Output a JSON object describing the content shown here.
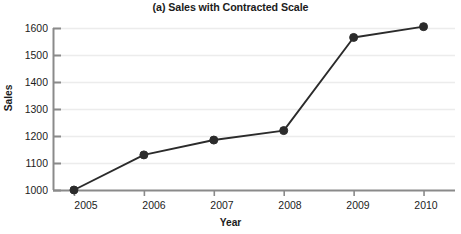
{
  "chart_data": {
    "type": "line",
    "title": "(a) Sales with Contracted Scale",
    "xlabel": "Year",
    "ylabel": "Sales",
    "categories": [
      "2005",
      "2006",
      "2007",
      "2008",
      "2009",
      "2010"
    ],
    "x": [
      2005,
      2006,
      2007,
      2008,
      2009,
      2010
    ],
    "values": [
      1000,
      1130,
      1185,
      1220,
      1565,
      1605
    ],
    "series": [
      {
        "name": "Sales",
        "values": [
          1000,
          1130,
          1185,
          1220,
          1565,
          1605
        ]
      }
    ],
    "xlim": [
      2004.7,
      2010.45
    ],
    "ylim": [
      1000,
      1600
    ],
    "ytick_labels": [
      "1000",
      "1100",
      "1200",
      "1300",
      "1400",
      "1500",
      "1600"
    ],
    "yticks": [
      1000,
      1100,
      1200,
      1300,
      1400,
      1500,
      1600
    ],
    "xtick_labels": [
      "2005",
      "2006",
      "2007",
      "2008",
      "2009",
      "2010"
    ],
    "grid": "horizontal",
    "legend": "none",
    "colors": {
      "line": "#2b2b2b",
      "marker": "#2b2b2b",
      "axis": "#8a8a8a",
      "grid": "#ececec",
      "text": "#1c1c1c",
      "background": "#ffffff"
    }
  }
}
